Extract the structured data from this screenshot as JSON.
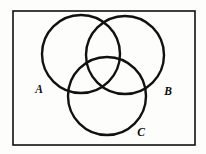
{
  "figure": {
    "background_color": "#fdfdfc",
    "stroke_color": "#111111",
    "universe": {
      "shape": "rectangle",
      "x": 13,
      "y": 11,
      "width": 182,
      "height": 134,
      "stroke_width": 1.6
    },
    "circle_stroke_width": 2.4,
    "circles": [
      {
        "id": "A",
        "cx": 81,
        "cy": 54,
        "r": 39
      },
      {
        "id": "B",
        "cx": 125,
        "cy": 55,
        "r": 39
      },
      {
        "id": "C",
        "cx": 107,
        "cy": 96,
        "r": 39
      }
    ],
    "labels": [
      {
        "id": "A",
        "text": "A",
        "x": 39,
        "y": 93
      },
      {
        "id": "B",
        "text": "B",
        "x": 168,
        "y": 95
      },
      {
        "id": "C",
        "text": "C",
        "x": 141,
        "y": 136
      }
    ]
  }
}
